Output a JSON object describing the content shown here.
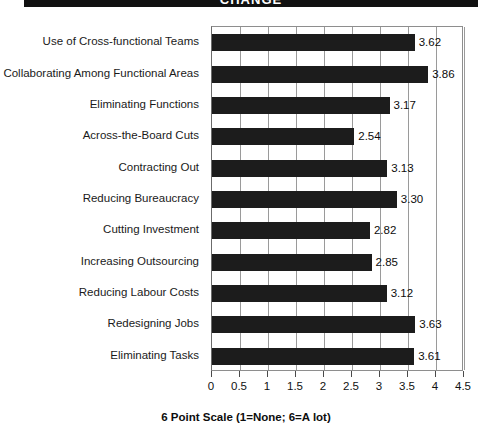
{
  "banner": {
    "title": "CHANGE"
  },
  "chart_data": {
    "type": "bar",
    "orientation": "horizontal",
    "title": "CHANGE",
    "xlabel": "6 Point Scale (1=None; 6=A lot)",
    "ylabel": "",
    "xlim": [
      0,
      4.5
    ],
    "xticks": [
      "0",
      "0.5",
      "1",
      "1.5",
      "2",
      "2.5",
      "3",
      "3.5",
      "4",
      "4.5"
    ],
    "xtick_values": [
      0,
      0.5,
      1,
      1.5,
      2,
      2.5,
      3,
      3.5,
      4,
      4.5
    ],
    "grid": true,
    "legend": false,
    "bar_color": "#1c1c1c",
    "categories": [
      "Use of Cross-functional Teams",
      "Collaborating Among Functional Areas",
      "Eliminating Functions",
      "Across-the-Board Cuts",
      "Contracting Out",
      "Reducing Bureaucracy",
      "Cutting Investment",
      "Increasing Outsourcing",
      "Reducing Labour Costs",
      "Redesigning Jobs",
      "Eliminating Tasks"
    ],
    "values": [
      3.62,
      3.86,
      3.17,
      2.54,
      3.13,
      3.3,
      2.82,
      2.85,
      3.12,
      3.63,
      3.61
    ],
    "value_labels": [
      "3.62",
      "3.86",
      "3.17",
      "2.54",
      "3.13",
      "3.30",
      "2.82",
      "2.85",
      "3.12",
      "3.63",
      "3.61"
    ]
  }
}
